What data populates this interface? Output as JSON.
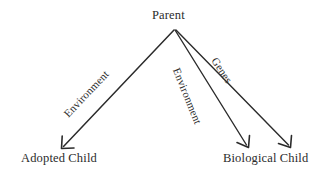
{
  "diagram": {
    "background_color": "#ffffff",
    "stroke_color": "#2b2b2b",
    "text_color": "#2b2b2b",
    "nodes": [
      {
        "id": "parent",
        "label": "Parent"
      },
      {
        "id": "adopted_child",
        "label": "Adopted Child"
      },
      {
        "id": "biological_child",
        "label": "Biological Child"
      }
    ],
    "edges": [
      {
        "id": "parent_to_adopted",
        "label": "Environment",
        "from": "parent",
        "to": "adopted_child",
        "from_point": [
          174,
          30
        ],
        "to_point": [
          62,
          148
        ]
      },
      {
        "id": "parent_to_biological_environment",
        "label": "Environment",
        "from": "parent",
        "to": "biological_child",
        "from_point": [
          175,
          30
        ],
        "to_point": [
          248,
          147
        ]
      },
      {
        "id": "parent_to_biological_genes",
        "label": "Genes",
        "from": "parent",
        "to": "biological_child",
        "from_point": [
          176,
          30
        ],
        "to_point": [
          290,
          147
        ]
      }
    ]
  }
}
